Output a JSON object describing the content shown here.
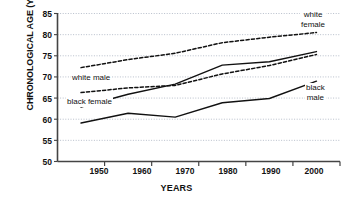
{
  "chart_data": {
    "type": "line",
    "title": "",
    "xlabel": "YEARS",
    "ylabel": "CHRONOLOGICAL AGE (YEARS)",
    "xlim": [
      1945,
      2005
    ],
    "ylim": [
      50,
      85
    ],
    "ytick_values": [
      50,
      55,
      60,
      65,
      70,
      75,
      80,
      85
    ],
    "ytick_labels": [
      "50",
      "55",
      "60",
      "65",
      "70",
      "75",
      "80",
      "85"
    ],
    "xtick_values": [
      1950,
      1960,
      1970,
      1980,
      1990,
      2000
    ],
    "xtick_labels": [
      "1950",
      "1960",
      "1970",
      "1980",
      "1990",
      "2000"
    ],
    "x_minor_ticks": [
      1955,
      1965,
      1975,
      1985,
      1995
    ],
    "grid": "horizontal-dotted",
    "legend_position": "inline-annotations",
    "x": [
      1950,
      1960,
      1970,
      1980,
      1990,
      2000
    ],
    "series": [
      {
        "name": "white female",
        "style": "dashed",
        "values": [
          72.2,
          74.1,
          75.6,
          78.1,
          79.4,
          80.5
        ]
      },
      {
        "name": "white male",
        "style": "dashed",
        "values": [
          66.3,
          67.4,
          68.0,
          70.7,
          72.7,
          75.3
        ]
      },
      {
        "name": "black female",
        "style": "solid",
        "values": [
          62.9,
          65.9,
          68.3,
          72.8,
          73.6,
          76.0
        ]
      },
      {
        "name": "black male",
        "style": "solid",
        "values": [
          59.1,
          61.4,
          60.5,
          63.9,
          64.9,
          69.0
        ]
      }
    ],
    "annotations": [
      {
        "text": "white female",
        "lines": [
          "white",
          "female"
        ],
        "series": "white female"
      },
      {
        "text": "white male",
        "lines": [
          "white male"
        ],
        "series": "white male"
      },
      {
        "text": "black female",
        "lines": [
          "black female"
        ],
        "series": "black female"
      },
      {
        "text": "black male",
        "lines": [
          "black",
          "male"
        ],
        "series": "black male"
      }
    ]
  },
  "colors": {
    "line": "#111111",
    "axis": "#444444",
    "grid": "#9aa3b5",
    "background": "#ffffff",
    "text": "#111111"
  },
  "ticks": {
    "y": [
      {
        "label": "85",
        "top": "9"
      },
      {
        "label": "80",
        "top": "30"
      },
      {
        "label": "75",
        "top": "51"
      },
      {
        "label": "70",
        "top": "72"
      },
      {
        "label": "65",
        "top": "94"
      },
      {
        "label": "60",
        "top": "115"
      },
      {
        "label": "55",
        "top": "136"
      },
      {
        "label": "50",
        "top": "157"
      }
    ],
    "x": [
      {
        "label": "1950",
        "left": "79"
      },
      {
        "label": "1960",
        "left": "122"
      },
      {
        "label": "1970",
        "left": "165"
      },
      {
        "label": "1980",
        "left": "208"
      },
      {
        "label": "1990",
        "left": "251"
      },
      {
        "label": "2000",
        "left": "294"
      }
    ]
  },
  "annotation_positions": [
    {
      "key": "white-female",
      "left": "300",
      "top": "10",
      "two_line": true,
      "line1": "white",
      "line2": "female"
    },
    {
      "key": "white-male",
      "left": "71",
      "top": "73",
      "two_line": false,
      "line1": "white male",
      "line2": ""
    },
    {
      "key": "black-female",
      "left": "66",
      "top": "97",
      "two_line": false,
      "line1": "black female",
      "line2": ""
    },
    {
      "key": "black-male",
      "left": "305",
      "top": "83",
      "two_line": true,
      "line1": "black",
      "line2": "male"
    }
  ]
}
